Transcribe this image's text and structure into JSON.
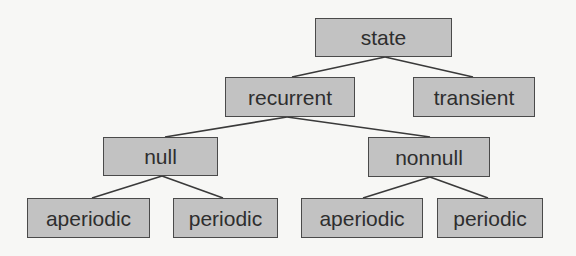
{
  "diagram": {
    "type": "tree",
    "colors": {
      "background": "#f7f7f5",
      "node_fill": "#c2c2c2",
      "node_border": "#4a4a4a",
      "text": "#2e2e2e",
      "edge": "#3a3a3a"
    },
    "nodes": {
      "state": {
        "label": "state",
        "x": 315,
        "y": 18,
        "w": 137,
        "h": 39
      },
      "recurrent": {
        "label": "recurrent",
        "x": 225,
        "y": 77,
        "w": 130,
        "h": 40
      },
      "transient": {
        "label": "transient",
        "x": 413,
        "y": 77,
        "w": 122,
        "h": 40
      },
      "null": {
        "label": "null",
        "x": 103,
        "y": 137,
        "w": 115,
        "h": 39
      },
      "nonnull": {
        "label": "nonnull",
        "x": 368,
        "y": 137,
        "w": 122,
        "h": 40
      },
      "aperiodic1": {
        "label": "aperiodic",
        "x": 27,
        "y": 198,
        "w": 123,
        "h": 40
      },
      "periodic1": {
        "label": "periodic",
        "x": 173,
        "y": 198,
        "w": 105,
        "h": 40
      },
      "aperiodic2": {
        "label": "aperiodic",
        "x": 301,
        "y": 198,
        "w": 122,
        "h": 40
      },
      "periodic2": {
        "label": "periodic",
        "x": 437,
        "y": 198,
        "w": 106,
        "h": 40
      }
    },
    "edges": [
      {
        "from": "state",
        "to": "recurrent",
        "x1": 385,
        "y1": 57,
        "x2": 292,
        "y2": 77
      },
      {
        "from": "state",
        "to": "transient",
        "x1": 385,
        "y1": 57,
        "x2": 473,
        "y2": 77
      },
      {
        "from": "recurrent",
        "to": "null",
        "x1": 287,
        "y1": 117,
        "x2": 165,
        "y2": 137
      },
      {
        "from": "recurrent",
        "to": "nonnull",
        "x1": 287,
        "y1": 117,
        "x2": 430,
        "y2": 137
      },
      {
        "from": "null",
        "to": "aperiodic1",
        "x1": 162,
        "y1": 176,
        "x2": 92,
        "y2": 198
      },
      {
        "from": "null",
        "to": "periodic1",
        "x1": 162,
        "y1": 176,
        "x2": 223,
        "y2": 198
      },
      {
        "from": "nonnull",
        "to": "aperiodic2",
        "x1": 430,
        "y1": 177,
        "x2": 363,
        "y2": 198
      },
      {
        "from": "nonnull",
        "to": "periodic2",
        "x1": 430,
        "y1": 177,
        "x2": 488,
        "y2": 198
      }
    ]
  }
}
